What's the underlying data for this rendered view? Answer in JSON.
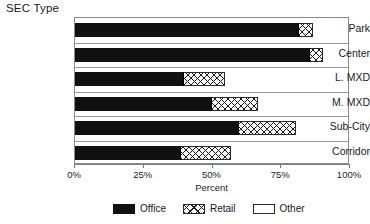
{
  "chart_data": {
    "type": "bar",
    "orientation": "horizontal",
    "stacked": true,
    "percent_stacked": true,
    "title": "SEC Type",
    "xlabel": "Percent",
    "ylabel": "",
    "xlim": [
      0,
      100
    ],
    "xticks": [
      0,
      25,
      50,
      75,
      100
    ],
    "xtick_labels": [
      "0%",
      "25%",
      "50%",
      "75%",
      "100%"
    ],
    "grid": true,
    "grid_axis": "y-rows",
    "legend_position": "bottom",
    "categories": [
      "Park",
      "Center",
      "L. MXD",
      "M. MXD",
      "Sub-City",
      "Corridor"
    ],
    "series": [
      {
        "name": "Office",
        "color": "#111111",
        "pattern": "solid",
        "values": [
          82,
          86,
          40,
          50,
          60,
          39
        ]
      },
      {
        "name": "Retail",
        "color": "#1b1b1b",
        "pattern": "crosshatch",
        "values": [
          5,
          5,
          15,
          17,
          21,
          18
        ]
      },
      {
        "name": "Other",
        "color": "#ffffff",
        "pattern": "empty",
        "values": [
          13,
          9,
          45,
          33,
          19,
          43
        ]
      }
    ]
  },
  "title": {
    "text": "SEC Type"
  },
  "axis": {
    "x": {
      "label": "Percent",
      "ticks": [
        {
          "value": 0,
          "label": "0%"
        },
        {
          "value": 25,
          "label": "25%"
        },
        {
          "value": 50,
          "label": "50%"
        },
        {
          "value": 75,
          "label": "75%"
        },
        {
          "value": 100,
          "label": "100%"
        }
      ]
    },
    "y": {
      "categories": [
        {
          "label": "Park"
        },
        {
          "label": "Center"
        },
        {
          "label": "L. MXD"
        },
        {
          "label": "M. MXD"
        },
        {
          "label": "Sub-City"
        },
        {
          "label": "Corridor"
        }
      ]
    }
  },
  "legend": {
    "items": [
      {
        "label": "Office",
        "swatch": "solid-black-swatch"
      },
      {
        "label": "Retail",
        "swatch": "crosshatch-swatch"
      },
      {
        "label": "Other",
        "swatch": "empty-swatch"
      }
    ]
  }
}
